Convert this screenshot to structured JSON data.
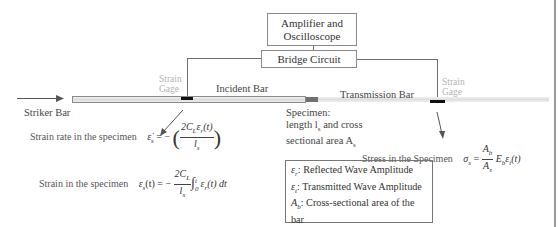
{
  "diagram": {
    "title_boxes": {
      "amplifier": "Amplifier and Oscilloscope",
      "amplifier_line1": "Amplifier and",
      "amplifier_line2": "Oscilloscope",
      "bridge": "Bridge Circuit"
    },
    "labels": {
      "striker_bar": "Striker Bar",
      "incident_bar": "Incident Bar",
      "transmission_bar": "Transmission  Bar",
      "strain_gage_left_1": "Strain",
      "strain_gage_left_2": "Gage",
      "strain_gage_right_1": "Strain",
      "strain_gage_right_2": "Gage",
      "specimen_1": "Specimen:",
      "specimen_2": "length l",
      "specimen_2_sub": "s",
      "specimen_2_tail": " and cross",
      "specimen_3": "sectional area A",
      "specimen_3_sub": "s"
    },
    "equations": {
      "strain_rate": {
        "label": "Strain rate in the specimen",
        "lhs": "ε̇",
        "lhs_sub": "s",
        "eq": " = − ",
        "numerator": "2C_L ε_r(t)",
        "num_a": "2C",
        "num_a_sub": "L",
        "num_b": "ε",
        "num_b_sub": "r",
        "num_c": "(t)",
        "denominator": "l",
        "denominator_sub": "s"
      },
      "strain": {
        "label": "Strain in the specimen",
        "lhs": "ε",
        "lhs_sub": "s",
        "lhs_tail": "(t) = − ",
        "num_a": "2C",
        "num_a_sub": "L",
        "denominator": "l",
        "denominator_sub": "s",
        "integral": "∫",
        "int_upper": "t",
        "int_lower": "0",
        "integrand": "ε",
        "integrand_sub": "r",
        "integrand_tail": "(t) dt"
      },
      "stress": {
        "label": "Stress in the Specimen",
        "lhs": "σ",
        "lhs_sub": "s",
        "eq": " = ",
        "num": "A",
        "num_sub": "b",
        "den": "A",
        "den_sub": "s",
        "tail_a": " E",
        "tail_a_sub": "b",
        "tail_b": "ε",
        "tail_b_sub": "t",
        "tail_c": "(t)"
      }
    },
    "legend": [
      {
        "symbol": "ε",
        "sub": "r",
        "text": ": Reflected Wave Amplitude"
      },
      {
        "symbol": "ε",
        "sub": "t",
        "text": ": Transmitted Wave Amplitude"
      },
      {
        "symbol": "A",
        "sub": "b",
        "text": ": Cross-sectional area of the bar"
      },
      {
        "symbol": "E",
        "sub": "b",
        "text": ": Young's Modulus of the Bar"
      }
    ],
    "colors": {
      "line": "#6e6e6e",
      "gage": "#111111",
      "gage_label": "#b4b4b4",
      "specimen": "#707070"
    }
  }
}
